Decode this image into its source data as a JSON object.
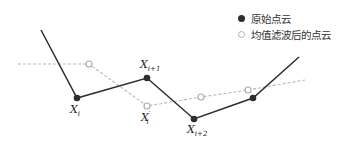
{
  "legend": {
    "items": [
      {
        "label": "原始点云",
        "marker": "filled-circle",
        "color": "#2e2e2e"
      },
      {
        "label": "均值滤波后的点云",
        "marker": "hollow-circle",
        "color": "#b0b0b0"
      }
    ]
  },
  "original_cloud": {
    "color": "#2e2e2e",
    "line_style": "solid",
    "points": [
      [
        41,
        30
      ],
      [
        77,
        98
      ],
      [
        147,
        78
      ],
      [
        194,
        119
      ],
      [
        253,
        98
      ],
      [
        299,
        57
      ]
    ],
    "marked_points": [
      [
        77,
        98
      ],
      [
        147,
        78
      ],
      [
        194,
        119
      ],
      [
        253,
        98
      ]
    ]
  },
  "filtered_cloud": {
    "color": "#b8b8b8",
    "line_style": "dashed",
    "points": [
      [
        18,
        64
      ],
      [
        89,
        64
      ],
      [
        147,
        106
      ],
      [
        201,
        97
      ],
      [
        248,
        90
      ],
      [
        305,
        80
      ]
    ],
    "marked_points": [
      [
        89,
        64
      ],
      [
        147,
        106
      ],
      [
        201,
        97
      ],
      [
        248,
        90
      ]
    ]
  },
  "labels": {
    "xi": {
      "base": "X",
      "sub": "i",
      "sup": ""
    },
    "xi1": {
      "base": "X",
      "sub": "i+1",
      "sup": ""
    },
    "xi2": {
      "base": "X",
      "sub": "i+2",
      "sup": ""
    },
    "xi_prime": {
      "base": "X",
      "sub": "i",
      "sup": "′"
    }
  }
}
